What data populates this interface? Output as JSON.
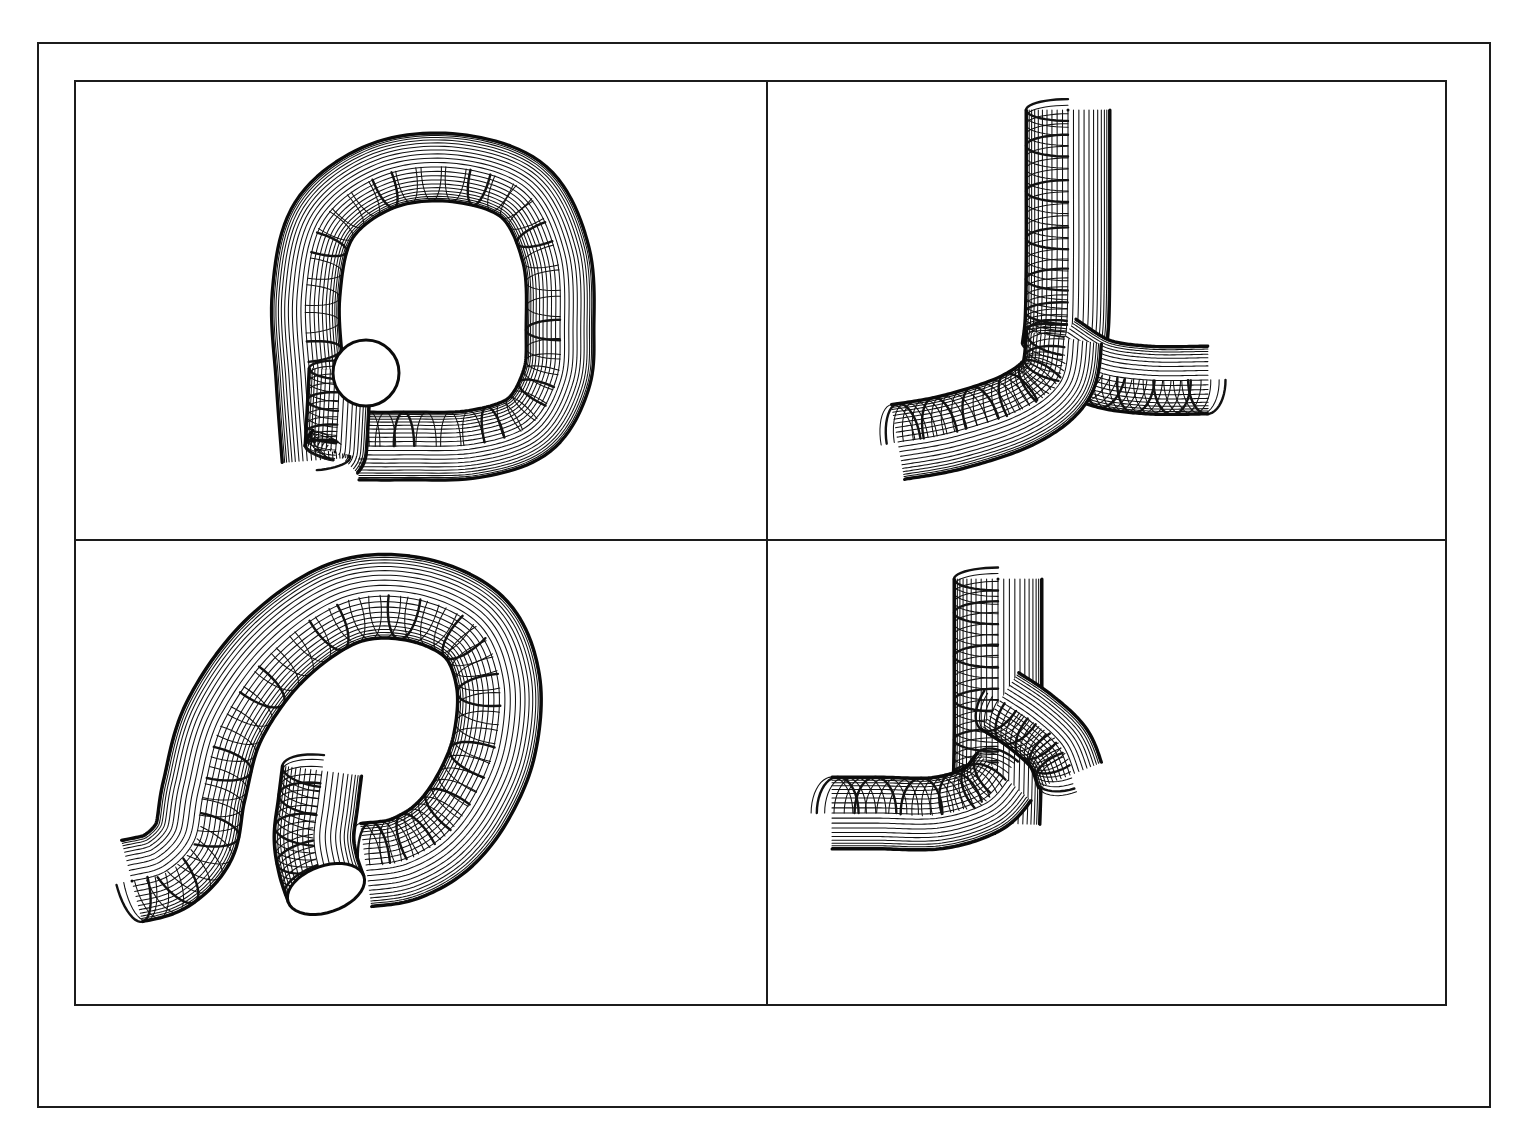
{
  "figure": {
    "background_color": "#ffffff",
    "line_color": "#111111",
    "width": 1523,
    "height": 1135,
    "outer_frame": {
      "x": 37,
      "y": 42,
      "w": 1450,
      "h": 1062
    },
    "panel_grid": {
      "x": 74,
      "y": 80,
      "w": 1373,
      "h": 926
    },
    "divider_v_x": 767,
    "divider_h_y": 540
  },
  "panels": [
    {
      "id": "panel-top-left",
      "position": "top-left",
      "shape_name": "closed-loop-tube",
      "description": "Hairpin / P-shaped closed tube loop with one circular open end cap at lower left",
      "row": 0,
      "col": 0,
      "bounds": {
        "x": 74,
        "y": 80,
        "w": 693,
        "h": 460
      },
      "has_end_cap": true,
      "end_cap_count": 1
    },
    {
      "id": "panel-top-right",
      "position": "top-right",
      "shape_name": "y-branch-tube",
      "description": "Vertical tube with rounded top that bifurcates into two lower branches forming a Y junction",
      "row": 0,
      "col": 1,
      "bounds": {
        "x": 767,
        "y": 80,
        "w": 680,
        "h": 460
      },
      "has_end_cap": false,
      "end_cap_count": 0
    },
    {
      "id": "panel-bottom-left",
      "position": "bottom-left",
      "shape_name": "open-loop-tube",
      "description": "Rotated hairpin tube viewed obliquely with two free ends, one showing an elliptical open cap",
      "row": 1,
      "col": 0,
      "bounds": {
        "x": 74,
        "y": 540,
        "w": 693,
        "h": 466
      },
      "has_end_cap": true,
      "end_cap_count": 1
    },
    {
      "id": "panel-bottom-right",
      "position": "bottom-right",
      "shape_name": "t-branch-tube",
      "description": "Vertical tube with rounded top and two side branches, one to the lower left and one to the middle right",
      "row": 1,
      "col": 1,
      "bounds": {
        "x": 767,
        "y": 540,
        "w": 680,
        "h": 466
      },
      "has_end_cap": false,
      "end_cap_count": 0
    }
  ],
  "mesh_style": {
    "longitudinal_lines": 26,
    "ring_spacing_px": 18,
    "longitudinal_stroke_width": 1.05,
    "ring_stroke_width": 2.4,
    "outline_stroke_width": 3.0,
    "surface_fill": "#ffffff",
    "stroke_color": "#111111"
  },
  "chart_data": {
    "type": "table",
    "categories": [
      "closed-loop-tube",
      "y-branch-tube",
      "open-loop-tube",
      "t-branch-tube"
    ],
    "values": [
      1,
      0,
      1,
      0
    ],
    "series": [
      {
        "name": "open_end_caps",
        "values": [
          1,
          0,
          1,
          0
        ]
      },
      {
        "name": "branch_points",
        "values": [
          0,
          1,
          0,
          2
        ]
      }
    ],
    "xlabel": "panel",
    "ylabel": "count",
    "legend": [
      "open_end_caps",
      "branch_points"
    ]
  }
}
